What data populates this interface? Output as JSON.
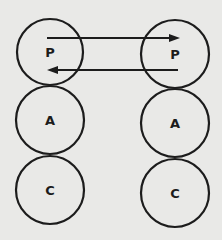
{
  "diagram": {
    "colors": {
      "background": "#e9e9e7",
      "stroke": "#1c1c1c"
    },
    "left_column": [
      {
        "label": "P",
        "cx": 50,
        "cy": 52,
        "r": 33
      },
      {
        "label": "A",
        "cx": 50,
        "cy": 120,
        "r": 34
      },
      {
        "label": "C",
        "cx": 50,
        "cy": 190,
        "r": 34
      }
    ],
    "right_column": [
      {
        "label": "P",
        "cx": 175,
        "cy": 54,
        "r": 34
      },
      {
        "label": "A",
        "cx": 175,
        "cy": 123,
        "r": 34
      },
      {
        "label": "C",
        "cx": 175,
        "cy": 193,
        "r": 34
      }
    ],
    "arrows": [
      {
        "name": "left-P-to-right-P",
        "x1": 47,
        "y1": 38,
        "x2": 180,
        "y2": 38,
        "direction": "right"
      },
      {
        "name": "right-P-to-left-P",
        "x1": 178,
        "y1": 70,
        "x2": 47,
        "y2": 70,
        "direction": "left"
      }
    ]
  }
}
